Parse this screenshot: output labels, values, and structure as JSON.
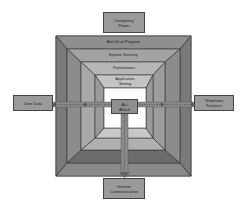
{
  "diagram": {
    "layers": [
      {
        "label": "Anti-Virus Program",
        "fill": "#8e8e8e"
      },
      {
        "label": "System Security",
        "fill": "#a2a2a2"
      },
      {
        "label": "Permissions",
        "fill": "#b6b6b6"
      },
      {
        "label": "Application\nVetting",
        "fill": "#c4c4c4"
      }
    ],
    "center": {
      "label": "Act\nAttack"
    },
    "external": {
      "top": {
        "label": "Computing\nPower"
      },
      "left": {
        "label": "User Data"
      },
      "right": {
        "label": "Telephone\nFeatures"
      },
      "bottom": {
        "label": "Internet\nCommunication"
      }
    },
    "colors": {
      "outer_frame": "#6e6e6e",
      "box_fill": "#9a9a9a",
      "inner_core": "#ffffff",
      "arrow_band": "#8a8a8a",
      "line": "#333333"
    }
  }
}
